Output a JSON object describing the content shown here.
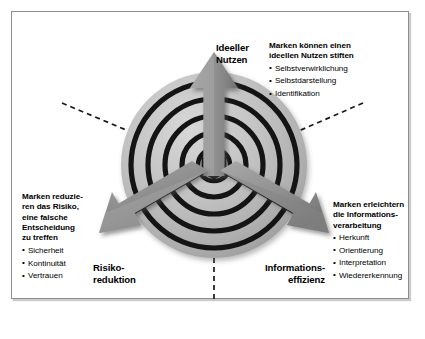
{
  "figure": {
    "type": "concept-diagram",
    "colors": {
      "frame_border": "#8d8d8d",
      "sphere_fill": "#bdbdbd",
      "ring_stroke": "#141414",
      "arrow_fill": "#8f8f8f",
      "arrow_shadow": "#5a5a5a",
      "text": "#000000",
      "background": "#ffffff"
    }
  },
  "axes": [
    {
      "id": "ideeller-nutzen",
      "label": "Ideeller\nNutzen",
      "direction": "up"
    },
    {
      "id": "risikoreduktion",
      "label": "Risiko-\nreduktion",
      "direction": "down-left"
    },
    {
      "id": "informationseffizienz",
      "label": "Informations-\neffizienz",
      "direction": "down-right"
    }
  ],
  "blocks": {
    "ideeller_nutzen": {
      "heading": "Marken können einen\nideellen Nutzen stiften",
      "items": [
        "Selbstverwirklichung",
        "Selbstdarstellung",
        "Identifikation"
      ]
    },
    "informationseffizienz": {
      "heading": "Marken erleichtern\ndie Informations-\nverarbeitung",
      "items": [
        "Herkunft",
        "Orientierung",
        "Interpretation",
        "Wiedererkennung"
      ]
    },
    "risikoreduktion": {
      "heading": "Marken reduzie-\nren das Risiko,\neine falsche\nEntscheidung\nzu treffen",
      "items": [
        "Sicherheit",
        "Kontinuität",
        "Vertrauen"
      ]
    }
  },
  "graphic": {
    "sphere": {
      "center_x": 214,
      "center_y": 165,
      "radius": 93,
      "ring_count": 5
    },
    "arrows": [
      {
        "name": "arrow-up",
        "angle_deg": 90
      },
      {
        "name": "arrow-down-left",
        "angle_deg": 210
      },
      {
        "name": "arrow-down-right",
        "angle_deg": 330
      }
    ],
    "leader_lines": [
      {
        "name": "leader-up-left",
        "style": "dashed"
      },
      {
        "name": "leader-up-right",
        "style": "dashed"
      },
      {
        "name": "leader-down",
        "style": "dashed"
      }
    ]
  }
}
